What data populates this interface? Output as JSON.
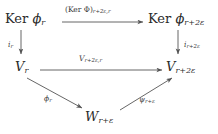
{
  "diagram": {
    "type": "commutative-diagram",
    "background_color": "#ffffff",
    "text_color": "#2b2b2b",
    "arrow_color": "#555555",
    "nodes": {
      "ker_phi_r": {
        "id": "ker-phi-r",
        "base": "Ker",
        "symbol": "ϕ",
        "subscript": "r",
        "full_text": "Ker ϕ_r"
      },
      "ker_phi_r_plus_2e": {
        "id": "ker-phi-r-plus-2e",
        "base": "Ker",
        "symbol": "ϕ",
        "subscript": "r+2ε",
        "full_text": "Ker ϕ_{r+2ε}"
      },
      "v_r": {
        "id": "v-r",
        "symbol": "V",
        "subscript": "r",
        "full_text": "V_r"
      },
      "v_r_plus_2e": {
        "id": "v-r-plus-2e",
        "symbol": "V",
        "subscript": "r+2ε",
        "full_text": "V_{r+2ε}"
      },
      "w_r_plus_e": {
        "id": "w-r-plus-e",
        "symbol": "W",
        "subscript": "r+ε",
        "full_text": "W_{r+ε}"
      }
    },
    "arrows": {
      "top_horizontal": {
        "from": "ker_phi_r",
        "to": "ker_phi_r_plus_2e",
        "label_main": "(Ker Φ)",
        "label_sub": "r+2ε,r",
        "full_label": "(Ker Φ)_{r+2ε,r}"
      },
      "left_vertical": {
        "from": "ker_phi_r",
        "to": "v_r",
        "label_main": "i",
        "label_sub": "r",
        "full_label": "i_r"
      },
      "right_vertical": {
        "from": "ker_phi_r_plus_2e",
        "to": "v_r_plus_2e",
        "label_main": "i",
        "label_sub": "r+2ε",
        "full_label": "i_{r+2ε}"
      },
      "middle_horizontal": {
        "from": "v_r",
        "to": "v_r_plus_2e",
        "label_main": "V",
        "label_sub": "r+2ε,r",
        "full_label": "V_{r+2ε,r}"
      },
      "left_diagonal": {
        "from": "v_r",
        "to": "w_r_plus_e",
        "label_main": "ϕ",
        "label_sub": "r",
        "full_label": "ϕ_r"
      },
      "right_diagonal": {
        "from": "w_r_plus_e",
        "to": "v_r_plus_2e",
        "label_main": "ψ",
        "label_sub": "r+ε",
        "full_label": "ψ_{r+ε}"
      }
    }
  }
}
